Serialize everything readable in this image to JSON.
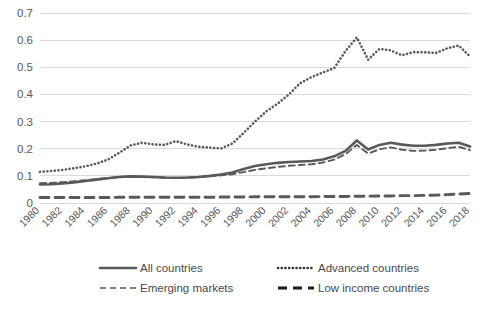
{
  "chart_data": {
    "type": "line",
    "title": "",
    "subtitle": "",
    "xlabel": "",
    "ylabel": "",
    "grid": "horizontal",
    "legend_position": "bottom",
    "xlim": [
      1980,
      2018
    ],
    "ylim": [
      0,
      0.7
    ],
    "y_ticks": [
      "0",
      "0.1",
      "0.2",
      "0.3",
      "0.4",
      "0.5",
      "0.6",
      "0.7"
    ],
    "y_tick_values": [
      0,
      0.1,
      0.2,
      0.3,
      0.4,
      0.5,
      0.6,
      0.7
    ],
    "x_tick_labels": [
      "1980",
      "1982",
      "1984",
      "1986",
      "1988",
      "1990",
      "1992",
      "1994",
      "1996",
      "1998",
      "2000",
      "2002",
      "2004",
      "2006",
      "2008",
      "2010",
      "2012",
      "2014",
      "2016",
      "2018"
    ],
    "x": [
      1980,
      1981,
      1982,
      1983,
      1984,
      1985,
      1986,
      1987,
      1988,
      1989,
      1990,
      1991,
      1992,
      1993,
      1994,
      1995,
      1996,
      1997,
      1998,
      1999,
      2000,
      2001,
      2002,
      2003,
      2004,
      2005,
      2006,
      2007,
      2008,
      2009,
      2010,
      2011,
      2012,
      2013,
      2014,
      2015,
      2016,
      2017,
      2018
    ],
    "series": [
      {
        "name": "All countries",
        "style": "solid",
        "color": "#595959",
        "values": [
          0.068,
          0.069,
          0.072,
          0.076,
          0.081,
          0.086,
          0.091,
          0.096,
          0.098,
          0.097,
          0.096,
          0.094,
          0.093,
          0.094,
          0.096,
          0.1,
          0.105,
          0.112,
          0.125,
          0.136,
          0.143,
          0.148,
          0.151,
          0.153,
          0.155,
          0.16,
          0.172,
          0.192,
          0.23,
          0.197,
          0.214,
          0.222,
          0.215,
          0.211,
          0.211,
          0.214,
          0.219,
          0.222,
          0.208
        ]
      },
      {
        "name": "Advanced countries",
        "style": "dotted",
        "color": "#333333",
        "values": [
          0.115,
          0.118,
          0.122,
          0.128,
          0.135,
          0.145,
          0.16,
          0.185,
          0.212,
          0.222,
          0.216,
          0.214,
          0.228,
          0.216,
          0.207,
          0.204,
          0.201,
          0.219,
          0.258,
          0.3,
          0.338,
          0.366,
          0.4,
          0.442,
          0.464,
          0.481,
          0.497,
          0.56,
          0.61,
          0.528,
          0.568,
          0.562,
          0.544,
          0.556,
          0.555,
          0.553,
          0.57,
          0.58,
          0.54
        ]
      },
      {
        "name": "Emerging markets",
        "style": "dashed",
        "color": "#808080",
        "values": [
          0.073,
          0.074,
          0.077,
          0.08,
          0.084,
          0.088,
          0.092,
          0.096,
          0.098,
          0.097,
          0.095,
          0.093,
          0.092,
          0.093,
          0.095,
          0.098,
          0.102,
          0.106,
          0.114,
          0.122,
          0.128,
          0.133,
          0.137,
          0.14,
          0.143,
          0.149,
          0.16,
          0.18,
          0.214,
          0.182,
          0.198,
          0.205,
          0.196,
          0.192,
          0.193,
          0.196,
          0.202,
          0.207,
          0.195
        ]
      },
      {
        "name": "Low income countries",
        "style": "longdash",
        "color": "#1a1a1a",
        "values": [
          0.02,
          0.02,
          0.02,
          0.02,
          0.02,
          0.02,
          0.02,
          0.021,
          0.021,
          0.021,
          0.021,
          0.021,
          0.021,
          0.021,
          0.021,
          0.021,
          0.022,
          0.022,
          0.022,
          0.023,
          0.023,
          0.023,
          0.023,
          0.023,
          0.023,
          0.024,
          0.024,
          0.024,
          0.025,
          0.025,
          0.026,
          0.026,
          0.027,
          0.027,
          0.028,
          0.029,
          0.031,
          0.033,
          0.035
        ]
      }
    ],
    "legend": [
      {
        "label": "All countries",
        "style": "solid"
      },
      {
        "label": "Advanced countries",
        "style": "dotted"
      },
      {
        "label": "Emerging markets",
        "style": "dashed"
      },
      {
        "label": "Low income countries",
        "style": "longdash"
      }
    ]
  }
}
